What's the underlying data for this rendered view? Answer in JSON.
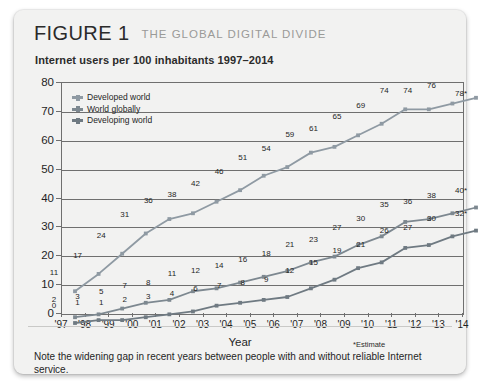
{
  "figure": {
    "label": "FIGURE 1",
    "title": "THE GLOBAL DIGITAL DIVIDE",
    "subtitle": "Internet users per 100 inhabitants 1997–2014",
    "caption": "Note the widening gap in recent years between people with and without reliable Internet service.",
    "estimate_note": "*Estimate"
  },
  "colors": {
    "developed": "#8f9aa3",
    "world": "#7d8890",
    "developing": "#6f7a82",
    "axis": "#6f6f6f",
    "card_bg": "#f2f2f1",
    "text": "#1f1f1f",
    "title_gray": "#9a9a98"
  },
  "chart_data": {
    "type": "line",
    "title": "Internet users per 100 inhabitants 1997–2014",
    "xlabel": "Year",
    "ylabel": "",
    "ylim": [
      0,
      80
    ],
    "yticks": [
      0,
      10,
      20,
      30,
      40,
      50,
      60,
      70,
      80
    ],
    "grid": true,
    "legend_position": "top-left",
    "x": [
      "'97",
      "'98",
      "'99",
      "'00",
      "'01",
      "'02",
      "'03",
      "'04",
      "'05",
      "'06",
      "'07",
      "'08",
      "'09",
      "'10",
      "'11",
      "'12",
      "'13",
      "'14"
    ],
    "series": [
      {
        "name": "Developed world",
        "values": [
          11,
          17,
          24,
          31,
          36,
          38,
          42,
          46,
          51,
          54,
          59,
          61,
          65,
          69,
          74,
          74,
          76,
          78
        ],
        "labels": [
          "11",
          "17",
          "24",
          "31",
          "36",
          "38",
          "42",
          "46",
          "51",
          "54",
          "59",
          "61",
          "65",
          "69",
          "74",
          "74",
          "76",
          "78*"
        ]
      },
      {
        "name": "World globally",
        "values": [
          2,
          3,
          5,
          7,
          8,
          11,
          12,
          14,
          16,
          18,
          21,
          23,
          27,
          30,
          35,
          36,
          38,
          40
        ],
        "labels": [
          "2",
          "3",
          "5",
          "7",
          "8",
          "11",
          "12",
          "14",
          "16",
          "18",
          "21",
          "23",
          "27",
          "30",
          "35",
          "36",
          "38",
          "40*"
        ]
      },
      {
        "name": "Developing world",
        "values": [
          0,
          1,
          1,
          2,
          3,
          4,
          6,
          7,
          8,
          9,
          12,
          15,
          19,
          21,
          26,
          27,
          30,
          32
        ],
        "labels": [
          "0",
          "1",
          "1",
          "2",
          "3",
          "4",
          "6",
          "7",
          "8",
          "9",
          "12",
          "15",
          "19",
          "21",
          "26",
          "27",
          "30",
          "32*"
        ]
      }
    ]
  }
}
